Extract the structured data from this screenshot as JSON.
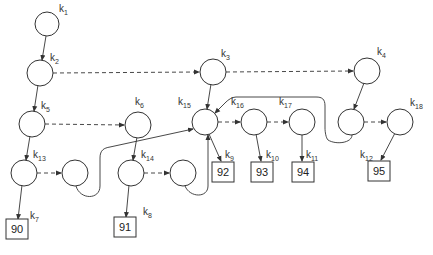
{
  "diagram": {
    "type": "linked-tree",
    "colors": {
      "stroke": "#333333",
      "background": "#ffffff"
    },
    "nodes": [
      {
        "id": "k1",
        "label": "k",
        "sub": "1"
      },
      {
        "id": "k2",
        "label": "k",
        "sub": "2"
      },
      {
        "id": "k3",
        "label": "k",
        "sub": "3"
      },
      {
        "id": "k4",
        "label": "k",
        "sub": "4"
      },
      {
        "id": "k5",
        "label": "k",
        "sub": "5"
      },
      {
        "id": "k6",
        "label": "k",
        "sub": "6"
      },
      {
        "id": "k13",
        "label": "k",
        "sub": "13"
      },
      {
        "id": "k14",
        "label": "k",
        "sub": "14"
      },
      {
        "id": "k15",
        "label": "k",
        "sub": "15"
      },
      {
        "id": "k16",
        "label": "k",
        "sub": "16"
      },
      {
        "id": "k17",
        "label": "k",
        "sub": "17"
      },
      {
        "id": "k18",
        "label": "k",
        "sub": "18"
      }
    ],
    "leaves": [
      {
        "id": "leaf90",
        "value": "90",
        "key": {
          "label": "k",
          "sub": "7"
        }
      },
      {
        "id": "leaf91",
        "value": "91",
        "key": {
          "label": "k",
          "sub": "8"
        }
      },
      {
        "id": "leaf92",
        "value": "92",
        "key": {
          "label": "k",
          "sub": "9"
        }
      },
      {
        "id": "leaf93",
        "value": "93",
        "key": {
          "label": "k",
          "sub": "10"
        }
      },
      {
        "id": "leaf94",
        "value": "94",
        "key": {
          "label": "k",
          "sub": "11"
        }
      },
      {
        "id": "leaf95",
        "value": "95",
        "key": {
          "label": "k",
          "sub": "12"
        }
      }
    ]
  }
}
